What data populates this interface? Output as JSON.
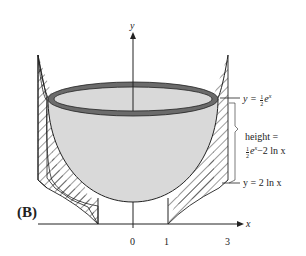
{
  "figure": {
    "panel_label": "(B)",
    "axes": {
      "x_label": "x",
      "y_label": "y",
      "x_ticks": [
        "0",
        "1",
        "3"
      ]
    },
    "annotations": {
      "top_curve": {
        "prefix": "y =",
        "frac_num": "1",
        "frac_den": "2",
        "expr": "e",
        "exp": "x"
      },
      "height_line1": "height =",
      "height_line2": {
        "frac_num": "1",
        "frac_den": "2",
        "expr": "e",
        "exp": "x",
        "rest": "−2 ln x"
      },
      "bottom_curve": "y = 2 ln x"
    },
    "colors": {
      "bowl_fill": "#d9d9d9",
      "rim": "#6b6b6b",
      "line": "#222222"
    }
  }
}
